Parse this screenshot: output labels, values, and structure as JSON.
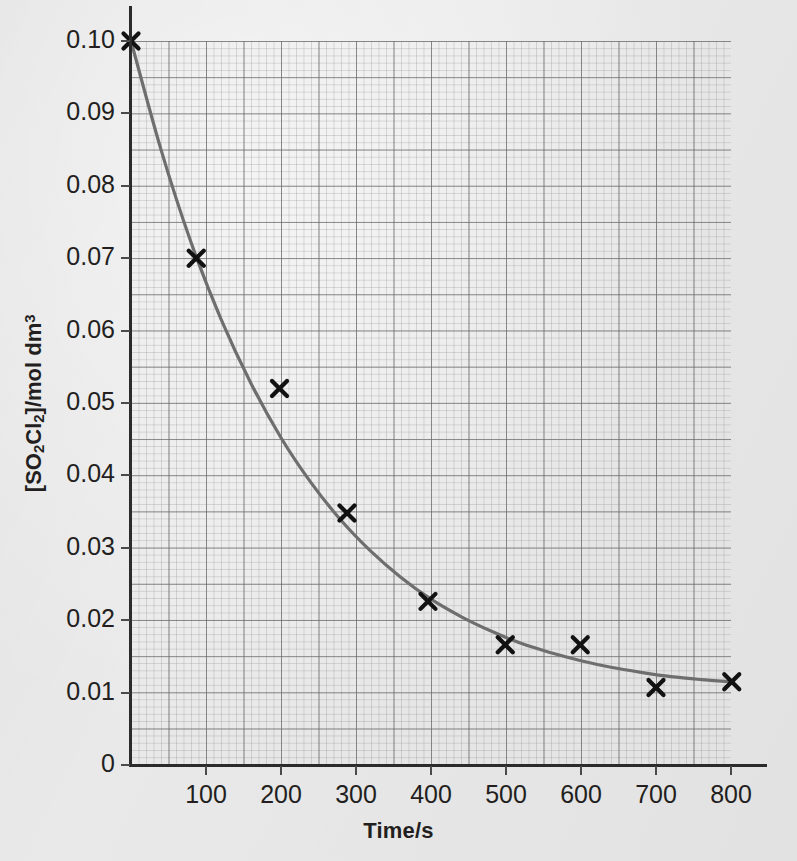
{
  "chart_data": {
    "type": "scatter",
    "title": "",
    "xlabel": "Time/s",
    "ylabel": "[SO2Cl2]/mol dm3",
    "ylabel_parts": {
      "open_bracket": "[SO",
      "sub1": "2",
      "mid": "Cl",
      "sub2": "2",
      "close": "]/mol dm",
      "sup": "3"
    },
    "xlim": [
      0,
      800
    ],
    "ylim": [
      0,
      0.1
    ],
    "xticks": [
      100,
      200,
      300,
      400,
      500,
      600,
      700,
      800
    ],
    "xtick_labels": [
      "100",
      "200",
      "300",
      "400",
      "500",
      "600",
      "700",
      "800"
    ],
    "yticks": [
      0,
      0.01,
      0.02,
      0.03,
      0.04,
      0.05,
      0.06,
      0.07,
      0.08,
      0.09,
      0.1
    ],
    "ytick_labels": [
      "0",
      "0.01",
      "0.02",
      "0.03",
      "0.04",
      "0.05",
      "0.06",
      "0.07",
      "0.08",
      "0.09",
      "0.10"
    ],
    "grid": true,
    "grid_major_x_step": 50,
    "grid_major_y_step": 0.005,
    "grid_minor_x_step": 10,
    "grid_minor_y_step": 0.001,
    "legend": "none",
    "marker_style": "x",
    "marker_color": "#111111",
    "line_color": "#6e6e6e",
    "background_color": "#e9e9e9",
    "series": [
      {
        "name": "[SO2Cl2] data points",
        "marker": "x",
        "x": [
          0,
          87,
          198,
          288,
          396,
          499,
          599,
          700,
          801
        ],
        "y": [
          0.1,
          0.07,
          0.052,
          0.0348,
          0.0226,
          0.0166,
          0.0166,
          0.0107,
          0.0115
        ]
      },
      {
        "name": "fitted decay curve",
        "type": "line",
        "x": [
          0,
          40,
          80,
          120,
          160,
          200,
          240,
          280,
          320,
          360,
          400,
          440,
          480,
          520,
          560,
          600,
          640,
          680,
          720,
          760,
          800
        ],
        "y": [
          0.1,
          0.085,
          0.0722,
          0.0616,
          0.0527,
          0.0452,
          0.039,
          0.0338,
          0.0295,
          0.0259,
          0.0229,
          0.0205,
          0.0185,
          0.0168,
          0.0155,
          0.0144,
          0.0135,
          0.0128,
          0.0122,
          0.0118,
          0.0115
        ]
      }
    ]
  },
  "axes": {
    "x_title": "Time/s",
    "x_tick_values": [
      "100",
      "200",
      "300",
      "400",
      "500",
      "600",
      "700",
      "800"
    ],
    "y_tick_values": [
      "0.10",
      "0.09",
      "0.08",
      "0.07",
      "0.06",
      "0.05",
      "0.04",
      "0.03",
      "0.02",
      "0.01",
      "0"
    ]
  }
}
